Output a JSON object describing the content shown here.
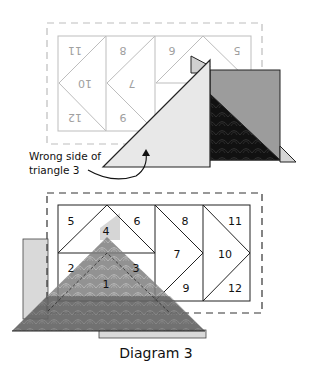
{
  "caption": "Diagram 3",
  "annotation": {
    "line1": "Wrong side of",
    "line2": "triangle 3"
  },
  "colors": {
    "background": "#ffffff",
    "outline": "#222222",
    "ghost_outline": "#b8b8b8",
    "ghost_text": "#9a9a9a",
    "light_fabric": "#e6e6e6",
    "medium_fabric": "#9c9c9c",
    "dark_fabric": "#111111",
    "translucent_fabric": "#8a8a8a",
    "pale_strip": "#d9d9d9"
  },
  "top_diagram": {
    "description": "Reverse (mirrored) view of pattern with fabric added",
    "labels": [
      {
        "id": "11",
        "text": "11"
      },
      {
        "id": "10",
        "text": "10"
      },
      {
        "id": "12",
        "text": "12"
      },
      {
        "id": "8",
        "text": "8"
      },
      {
        "id": "7",
        "text": "7"
      },
      {
        "id": "9",
        "text": "9"
      },
      {
        "id": "6",
        "text": "6"
      },
      {
        "id": "5",
        "text": "5"
      }
    ]
  },
  "bottom_diagram": {
    "description": "Front view of foundation pattern",
    "labels": [
      {
        "id": "5",
        "text": "5"
      },
      {
        "id": "4",
        "text": "4"
      },
      {
        "id": "6",
        "text": "6"
      },
      {
        "id": "2",
        "text": "2"
      },
      {
        "id": "3",
        "text": "3"
      },
      {
        "id": "1",
        "text": "1"
      },
      {
        "id": "8",
        "text": "8"
      },
      {
        "id": "7",
        "text": "7"
      },
      {
        "id": "9",
        "text": "9"
      },
      {
        "id": "11",
        "text": "11"
      },
      {
        "id": "10",
        "text": "10"
      },
      {
        "id": "12",
        "text": "12"
      }
    ]
  }
}
